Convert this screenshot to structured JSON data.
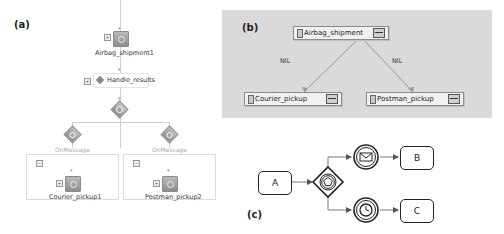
{
  "panel_a": {
    "label": "(a)",
    "invoke_top": "Airbag_shipment1",
    "assign": "Handle_results",
    "branches": [
      {
        "event": "OnMessage",
        "invoke": "Courier_pickup1"
      },
      {
        "event": "OnMessage",
        "invoke": "Postman_pickup2"
      }
    ]
  },
  "panel_b": {
    "label": "(b)",
    "root": "Airbag_shipment",
    "children": [
      "Courier_pickup",
      "Postman_pickup"
    ],
    "edge_labels": [
      "NIL",
      "NIL"
    ],
    "colors": {
      "background": "#dadada",
      "node": "#f0f0f0",
      "edge": "#9a9a9a"
    }
  },
  "panel_c": {
    "label": "(c)",
    "tasks": [
      "A",
      "B",
      "C"
    ],
    "gateway": "event-based-gateway",
    "events": [
      "message-intermediate-event",
      "timer-intermediate-event"
    ]
  }
}
